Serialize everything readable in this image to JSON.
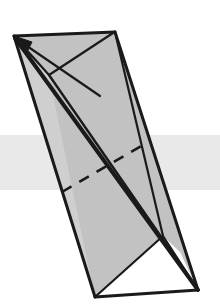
{
  "figure": {
    "width": 220,
    "height": 304,
    "background_color": "#ffffff",
    "colors": {
      "surface_fill": "#c2c2c2",
      "surface_fill_light": "#cfcfcf",
      "stroke": "#1a1a1a",
      "plane_band": "#e9e9e9",
      "white_face": "#ffffff"
    },
    "stroke_widths": {
      "outline": 3.0,
      "thick_diagonal": 4.0,
      "thin_fold": 2.2,
      "dashed": 2.6,
      "arrow_shaft": 2.2
    },
    "plane_band": {
      "label": "horizontal-cutting-plane",
      "x": 0,
      "y": 135,
      "width": 220,
      "height": 55,
      "fill": "#e9e9e9"
    },
    "vertices": {
      "apex_left": [
        14,
        36
      ],
      "top_right": [
        115,
        32
      ],
      "bottom_right": [
        198,
        290
      ],
      "bottom_left": [
        95,
        297
      ],
      "fold_vertex": [
        49,
        75
      ],
      "right_waist": [
        163,
        236
      ],
      "inner_tip": [
        196,
        288
      ]
    },
    "arrow": {
      "label": "direction-vector-arrow",
      "tail": [
        100,
        96
      ],
      "head": [
        16,
        38
      ],
      "head_size": 13
    },
    "dashed_line": {
      "label": "hidden-intersection-edge",
      "start": [
        62,
        192
      ],
      "end": [
        148,
        142
      ],
      "dash_pattern": "11 9"
    },
    "polygons": {
      "back_sheet": "14,36 115,32 198,290 95,297",
      "left_lobe": "14,36 49,75 95,297 62,192",
      "front_sheet": "49,75 115,32 198,290 95,297",
      "white_triangle": "95,297 198,290 163,236",
      "narrow_sliver": "14,36 163,236 198,290"
    },
    "lines": {
      "thick_diagonal": {
        "start": [
          15,
          38
        ],
        "end": [
          198,
          290
        ]
      },
      "fold_edge": {
        "start": [
          49,
          75
        ],
        "end": [
          198,
          290
        ]
      },
      "left_outline": {
        "start": [
          14,
          36
        ],
        "end": [
          95,
          297
        ]
      },
      "right_outline": {
        "start": [
          115,
          32
        ],
        "end": [
          198,
          290
        ]
      },
      "top_edge": {
        "start": [
          14,
          36
        ],
        "end": [
          115,
          32
        ]
      },
      "bottom_edge": {
        "start": [
          95,
          297
        ],
        "end": [
          198,
          290
        ]
      },
      "inner_right_fold": {
        "start": [
          115,
          32
        ],
        "end": [
          163,
          236
        ]
      },
      "waist_to_corner": {
        "start": [
          163,
          236
        ],
        "end": [
          95,
          297
        ]
      }
    }
  }
}
